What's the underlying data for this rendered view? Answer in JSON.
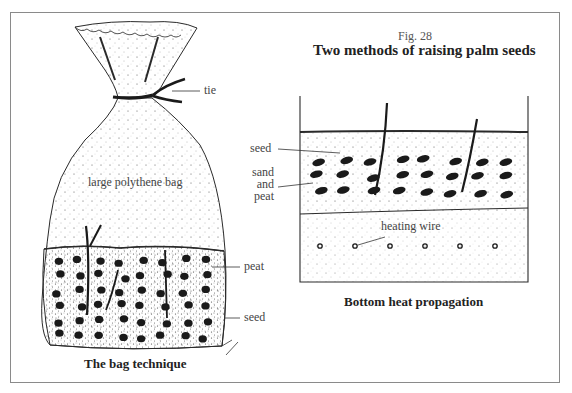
{
  "figure": {
    "number": "Fig. 28",
    "title": "Two methods of raising palm seeds"
  },
  "bag_technique": {
    "caption": "The bag technique",
    "labels": {
      "tie": "tie",
      "bag": "large polythene bag",
      "peat": "peat",
      "seed": "seed"
    }
  },
  "bottom_heat": {
    "caption": "Bottom heat propagation",
    "labels": {
      "seed": "seed",
      "sand_and_peat": [
        "sand",
        "and",
        "peat"
      ],
      "heating_wire": "heating wire"
    }
  },
  "colors": {
    "ink": "#2a2a2a",
    "frame": "#8a8a8a",
    "background": "#ffffff"
  }
}
